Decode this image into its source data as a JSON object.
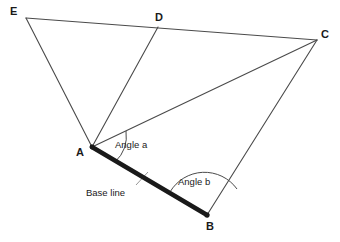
{
  "figure": {
    "type": "geometry-diagram",
    "background_color": "#ffffff",
    "line_color": "#4a4a4a",
    "baseline_color": "#1a1a1a",
    "width": 340,
    "height": 242
  },
  "vertices": [
    {
      "id": "E",
      "label": "E",
      "x": 26,
      "y": 18,
      "label_x": 10,
      "label_y": 6
    },
    {
      "id": "D",
      "label": "D",
      "x": 158,
      "y": 27,
      "label_x": 155,
      "label_y": 12
    },
    {
      "id": "C",
      "label": "C",
      "x": 317,
      "y": 40,
      "label_x": 321,
      "label_y": 29
    },
    {
      "id": "A",
      "label": "A",
      "x": 92,
      "y": 147,
      "label_x": 76,
      "label_y": 147
    },
    {
      "id": "B",
      "label": "B",
      "x": 207,
      "y": 215,
      "label_x": 206,
      "label_y": 221
    }
  ],
  "edges": [
    {
      "from": "E",
      "to": "C",
      "style": "thin",
      "note": "top line through D"
    },
    {
      "from": "E",
      "to": "A",
      "style": "thin"
    },
    {
      "from": "D",
      "to": "A",
      "style": "thin"
    },
    {
      "from": "C",
      "to": "A",
      "style": "thin"
    },
    {
      "from": "C",
      "to": "B",
      "style": "thin"
    },
    {
      "from": "A",
      "to": "B",
      "style": "thick",
      "name": "base line"
    }
  ],
  "annotations": {
    "angle_a": {
      "text": "Angle a",
      "vertex": "A",
      "x": 115,
      "y": 140
    },
    "angle_b": {
      "text": "Angle b",
      "vertex": "B",
      "x": 178,
      "y": 177
    },
    "base_line": {
      "text": "Base line",
      "x": 86,
      "y": 188
    }
  }
}
